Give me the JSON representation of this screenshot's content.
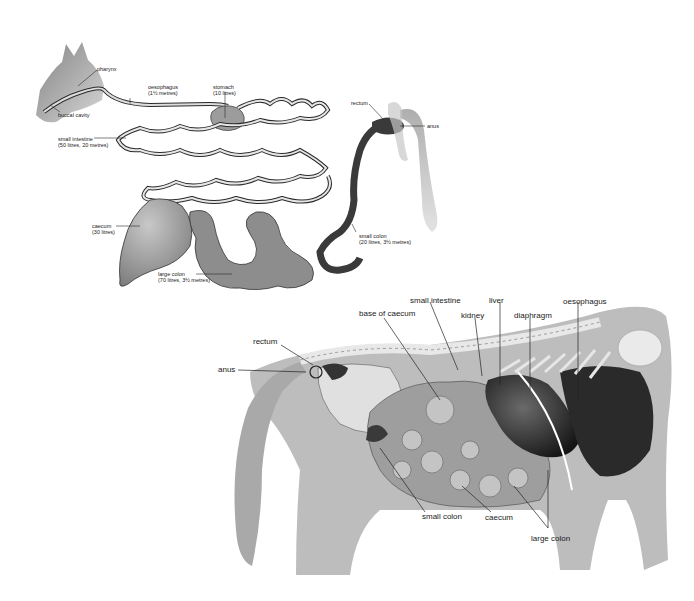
{
  "diagram": {
    "top": {
      "title": "Horse digestive tract (schematic)",
      "labels": {
        "pharynx": {
          "name": "pharynx"
        },
        "buccal_cavity": {
          "name": "buccal cavity"
        },
        "oesophagus": {
          "name": "oesophagus",
          "detail": "(1½ metres)"
        },
        "stomach": {
          "name": "stomach",
          "detail": "(10 litres)"
        },
        "rectum": {
          "name": "rectum"
        },
        "anus": {
          "name": "anus"
        },
        "small_intestine": {
          "name": "small intestine",
          "detail": "(50 litres, 20 metres)"
        },
        "caecum": {
          "name": "caecum",
          "detail": "(30 litres)"
        },
        "small_colon": {
          "name": "small colon",
          "detail": "(20 litres, 3½ metres)"
        },
        "large_colon": {
          "name": "large colon",
          "detail": "(70 litres, 3½ metres)"
        }
      }
    },
    "bottom": {
      "title": "Horse internal organs (anatomical)",
      "labels": {
        "small_intestine": "small intestine",
        "liver": "liver",
        "oesophagus": "oesophagus",
        "base_of_caecum": "base of caecum",
        "kidney": "kidney",
        "diaphragm": "diaphragm",
        "rectum": "rectum",
        "anus": "anus",
        "small_colon": "small colon",
        "caecum": "caecum",
        "large_colon": "large colon"
      }
    },
    "colors": {
      "outline": "#2a2a2a",
      "silhouette": "#b8b8b8",
      "organ_dark": "#3a3a3a",
      "organ_mid": "#8a8a8a",
      "organ_light": "#c9c9c9",
      "bone": "#e4e4e4"
    }
  }
}
